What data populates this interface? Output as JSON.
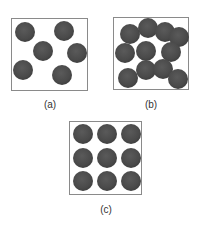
{
  "figure": {
    "particle_color": "#4a4a4a",
    "border_color": "#8a8a8a",
    "panels": [
      {
        "id": "a",
        "label": "(a)",
        "box": {
          "left": 11,
          "top": 18,
          "width": 77,
          "height": 73
        },
        "label_pos": {
          "x": 50,
          "y": 99
        },
        "radius": 10,
        "particles": [
          [
            25,
            32
          ],
          [
            64,
            31
          ],
          [
            43,
            51
          ],
          [
            77,
            53
          ],
          [
            23,
            70
          ],
          [
            62,
            75
          ]
        ]
      },
      {
        "id": "b",
        "label": "(b)",
        "box": {
          "left": 113,
          "top": 17,
          "width": 76,
          "height": 73
        },
        "label_pos": {
          "x": 151,
          "y": 99
        },
        "radius": 10,
        "particles": [
          [
            130,
            34
          ],
          [
            148,
            28
          ],
          [
            165,
            32
          ],
          [
            179,
            37
          ],
          [
            125,
            53
          ],
          [
            146,
            51
          ],
          [
            171,
            52
          ],
          [
            128,
            78
          ],
          [
            146,
            70
          ],
          [
            163,
            69
          ],
          [
            178,
            79
          ]
        ]
      },
      {
        "id": "c",
        "label": "(c)",
        "box": {
          "left": 69,
          "top": 121,
          "width": 73,
          "height": 74
        },
        "label_pos": {
          "x": 106,
          "y": 204
        },
        "radius": 10,
        "particles": [
          [
            83,
            134
          ],
          [
            107,
            134
          ],
          [
            131,
            134
          ],
          [
            83,
            158
          ],
          [
            107,
            158
          ],
          [
            131,
            158
          ],
          [
            83,
            181
          ],
          [
            107,
            181
          ],
          [
            131,
            181
          ]
        ]
      }
    ]
  }
}
